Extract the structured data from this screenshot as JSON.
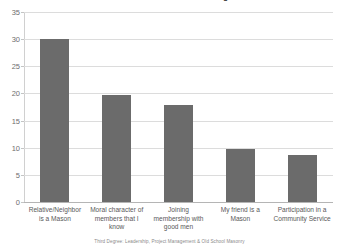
{
  "chart_data": {
    "type": "bar",
    "title": "Reasons for interest in becoming a Mason",
    "xlabel": "",
    "ylabel": "",
    "categories": [
      "Relative/Neighbor is a Mason",
      "Moral character of members that I know",
      "Joining membership with good men",
      "My friend is a Mason",
      "Participation in a Community Service"
    ],
    "values": [
      30,
      19.8,
      17.8,
      9.7,
      8.6
    ],
    "ylim": [
      0,
      35
    ],
    "yticks": [
      0,
      5,
      10,
      15,
      20,
      25,
      30,
      35
    ],
    "ytick_labels": [
      "0",
      "5",
      "10",
      "15",
      "20",
      "25",
      "30",
      "35"
    ],
    "grid": true,
    "legend": false,
    "bar_color": "#6b6b6b",
    "gridline_color": "#dcdcdc",
    "background_color": "#ffffff"
  },
  "footer": {
    "source_note": "Third Degree: Leadership, Project Management & Old School Masonry"
  }
}
